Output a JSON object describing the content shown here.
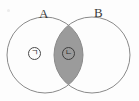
{
  "figure": {
    "kind": "venn-diagram",
    "background_color": "#fdfdfd",
    "stroke_color": "#8a8a8a",
    "shade_color": "#9b9b9b",
    "label_color": "#3a3a3a",
    "width": 139,
    "height": 101
  },
  "sets": [
    {
      "id": "A",
      "label": "A",
      "center_x": 45,
      "center_y": 55,
      "radius": 38,
      "fill": "none"
    },
    {
      "id": "B",
      "label": "B",
      "center_x": 92,
      "center_y": 55,
      "radius": 38,
      "fill": "none"
    }
  ],
  "regions": [
    {
      "id": "a-only",
      "marker_label": "ㄱ",
      "marker_x": 34,
      "marker_y": 53,
      "shaded": false,
      "description": "A only"
    },
    {
      "id": "intersection",
      "marker_label": "ㄴ",
      "marker_x": 68,
      "marker_y": 53,
      "shaded": true,
      "description": "A and B"
    }
  ],
  "shading": {
    "shaded_region": "intersection",
    "color": "#9b9b9b",
    "opacity": 1
  }
}
